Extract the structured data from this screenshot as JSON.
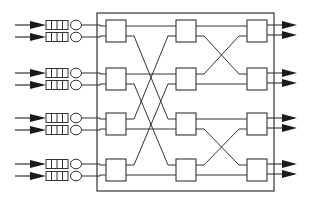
{
  "diagram": {
    "title": "",
    "type": "multistage-switch-network",
    "colors": {
      "line": "#333333",
      "arrow": "#1a1a1a",
      "box_fill": "#ffffff",
      "background": "#ffffff"
    },
    "outer_frame": {
      "x": 97,
      "y": 13,
      "w": 177,
      "h": 178
    },
    "stage_x": {
      "left": 106,
      "middle": 176,
      "right": 247
    },
    "box_size": {
      "w": 20,
      "h": 22
    },
    "box_tops": [
      20,
      68,
      113,
      159
    ],
    "port_offsets": [
      6,
      16
    ],
    "inputs": [
      {
        "id": "in-1",
        "y": 25,
        "queue_cells": 4
      },
      {
        "id": "in-2",
        "y": 37,
        "queue_cells": 4
      },
      {
        "id": "in-3",
        "y": 73,
        "queue_cells": 4
      },
      {
        "id": "in-4",
        "y": 85,
        "queue_cells": 4
      },
      {
        "id": "in-5",
        "y": 118,
        "queue_cells": 4
      },
      {
        "id": "in-6",
        "y": 130,
        "queue_cells": 4
      },
      {
        "id": "in-7",
        "y": 164,
        "queue_cells": 4
      },
      {
        "id": "in-8",
        "y": 176,
        "queue_cells": 4
      }
    ],
    "stage1_to_stage2": [
      {
        "from": [
          0,
          0
        ],
        "to": [
          0,
          0
        ]
      },
      {
        "from": [
          0,
          1
        ],
        "to": [
          2,
          0
        ]
      },
      {
        "from": [
          1,
          0
        ],
        "to": [
          1,
          0
        ]
      },
      {
        "from": [
          1,
          1
        ],
        "to": [
          3,
          0
        ]
      },
      {
        "from": [
          2,
          0
        ],
        "to": [
          0,
          1
        ]
      },
      {
        "from": [
          2,
          1
        ],
        "to": [
          2,
          1
        ]
      },
      {
        "from": [
          3,
          0
        ],
        "to": [
          1,
          1
        ]
      },
      {
        "from": [
          3,
          1
        ],
        "to": [
          3,
          1
        ]
      }
    ],
    "stage2_to_stage3": [
      {
        "from": [
          0,
          0
        ],
        "to": [
          0,
          0
        ]
      },
      {
        "from": [
          0,
          1
        ],
        "to": [
          1,
          0
        ]
      },
      {
        "from": [
          1,
          0
        ],
        "to": [
          0,
          1
        ]
      },
      {
        "from": [
          1,
          1
        ],
        "to": [
          1,
          1
        ]
      },
      {
        "from": [
          2,
          0
        ],
        "to": [
          2,
          0
        ]
      },
      {
        "from": [
          2,
          1
        ],
        "to": [
          3,
          0
        ]
      },
      {
        "from": [
          3,
          0
        ],
        "to": [
          2,
          1
        ]
      },
      {
        "from": [
          3,
          1
        ],
        "to": [
          3,
          1
        ]
      }
    ],
    "outputs_count": 8
  }
}
